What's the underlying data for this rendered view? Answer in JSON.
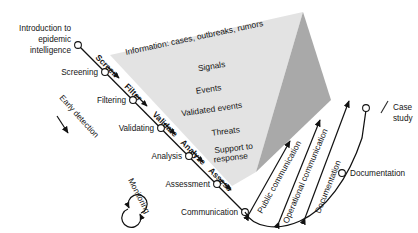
{
  "diagram": {
    "background_color": "#ffffff",
    "text_color": "#141414",
    "funnel_face_color": "#e3e3e3",
    "funnel_side_color": "#a9a9a9"
  },
  "left_labels": [
    {
      "id": "intro",
      "lines": [
        "Introduction to",
        "epidemic",
        "intelligence"
      ]
    },
    {
      "id": "screening",
      "text": "Screening"
    },
    {
      "id": "filtering",
      "text": "Filtering"
    },
    {
      "id": "validating",
      "text": "Validating"
    },
    {
      "id": "analysis",
      "text": "Analysis"
    },
    {
      "id": "assessment",
      "text": "Assessment"
    },
    {
      "id": "communication",
      "text": "Communication"
    }
  ],
  "chain_actions": [
    {
      "id": "screen",
      "text": "Screen"
    },
    {
      "id": "filter",
      "text": "Filter"
    },
    {
      "id": "validate",
      "text": "Validate"
    },
    {
      "id": "analyze",
      "text": "Analyze"
    },
    {
      "id": "assess",
      "text": "Assess"
    }
  ],
  "funnel_levels": [
    {
      "id": "information",
      "text": "Information: cases, outbreaks, rumors"
    },
    {
      "id": "signals",
      "text": "Signals"
    },
    {
      "id": "events",
      "text": "Events"
    },
    {
      "id": "validated-events",
      "text": "Validated events"
    },
    {
      "id": "threats",
      "text": "Threats"
    },
    {
      "id": "support",
      "lines": [
        "Support to",
        "response"
      ]
    }
  ],
  "annotations": [
    {
      "id": "early-detection",
      "text": "Early detection"
    },
    {
      "id": "monitoring",
      "text": "Monitoring"
    }
  ],
  "outputs": [
    {
      "id": "public-communication",
      "text": "Public communication"
    },
    {
      "id": "operational-communication",
      "text": "Operational communication"
    },
    {
      "id": "documentation-arrow",
      "text": "Documentation"
    }
  ],
  "right_labels": [
    {
      "id": "documentation",
      "text": "Documentation"
    },
    {
      "id": "case-study",
      "lines": [
        "Case",
        "study"
      ]
    }
  ]
}
